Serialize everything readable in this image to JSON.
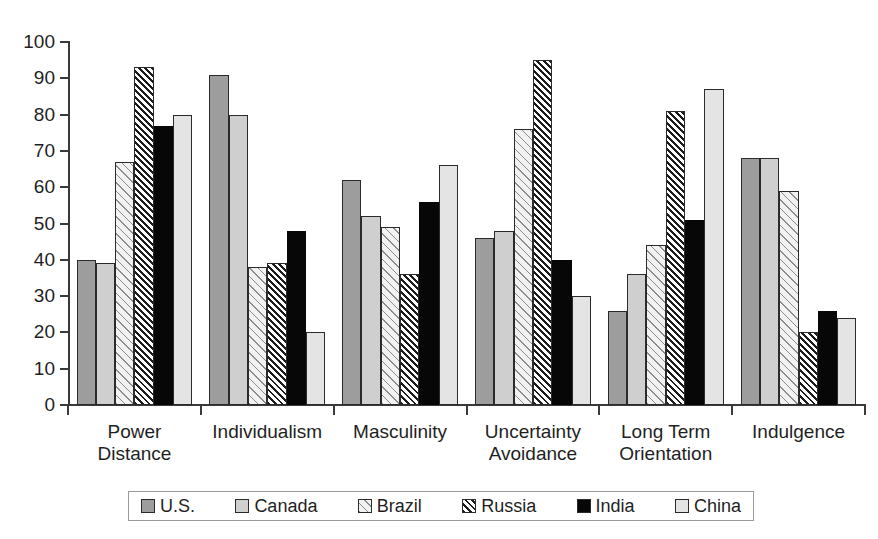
{
  "chart_data": {
    "type": "bar",
    "title": "",
    "xlabel": "",
    "ylabel": "",
    "ylim": [
      0,
      100
    ],
    "ytick_step": 10,
    "yticks": [
      "100",
      "90",
      "80",
      "70",
      "60",
      "50",
      "40",
      "30",
      "20",
      "10",
      "0"
    ],
    "grid": false,
    "legend_position": "bottom",
    "categories": [
      "Power Distance",
      "Individualism",
      "Masculinity",
      "Uncertainty Avoidance",
      "Long Term Orientation",
      "Indulgence"
    ],
    "category_lines": [
      [
        "Power",
        "Distance"
      ],
      [
        "Individualism"
      ],
      [
        "Masculinity"
      ],
      [
        "Uncertainty",
        "Avoidance"
      ],
      [
        "Long Term",
        "Orientation"
      ],
      [
        "Indulgence"
      ]
    ],
    "series": [
      {
        "name": "U.S.",
        "swatch": "solid-medium-gray",
        "color": "#9d9d9d",
        "values": [
          40,
          91,
          62,
          46,
          26,
          68
        ]
      },
      {
        "name": "Canada",
        "swatch": "solid-light-gray",
        "color": "#cfcfcf",
        "values": [
          39,
          80,
          52,
          48,
          36,
          68
        ]
      },
      {
        "name": "Brazil",
        "swatch": "sparse-diagonal-hatch",
        "color": "#f2f2f2",
        "values": [
          67,
          38,
          49,
          76,
          44,
          59
        ]
      },
      {
        "name": "Russia",
        "swatch": "dense-diagonal-hatch",
        "color": "#ffffff",
        "values": [
          93,
          39,
          36,
          95,
          81,
          20
        ]
      },
      {
        "name": "India",
        "swatch": "solid-black",
        "color": "#070707",
        "values": [
          77,
          48,
          56,
          40,
          51,
          26
        ]
      },
      {
        "name": "China",
        "swatch": "solid-very-light-gray",
        "color": "#e4e4e4",
        "values": [
          80,
          20,
          66,
          30,
          87,
          24
        ]
      }
    ]
  },
  "legend": {
    "items": [
      "U.S.",
      "Canada",
      "Brazil",
      "Russia",
      "India",
      "China"
    ]
  }
}
